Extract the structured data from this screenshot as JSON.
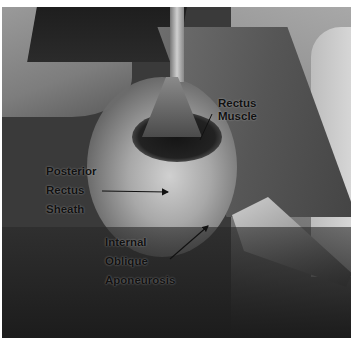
{
  "figure": {
    "type": "annotated surgical photograph (grayscale)",
    "labels": [
      {
        "id": "rectus-muscle",
        "lines": [
          "Rectus",
          "Muscle"
        ]
      },
      {
        "id": "posterior-rectus-sheath",
        "lines": [
          "Posterior",
          "Rectus",
          "Sheath"
        ]
      },
      {
        "id": "internal-oblique-aponeurosis",
        "lines": [
          "Internal",
          "Oblique",
          "Aponeurosis"
        ]
      }
    ]
  }
}
